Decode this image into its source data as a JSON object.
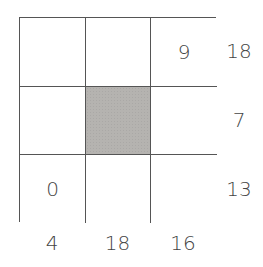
{
  "puzzle": {
    "grid": {
      "rows": 3,
      "cols": 3,
      "cells": [
        [
          {
            "value": "",
            "shaded": false
          },
          {
            "value": "",
            "shaded": false
          },
          {
            "value": "9",
            "shaded": false
          }
        ],
        [
          {
            "value": "",
            "shaded": false
          },
          {
            "value": "",
            "shaded": true
          },
          {
            "value": "",
            "shaded": false
          }
        ],
        [
          {
            "value": "0",
            "shaded": false
          },
          {
            "value": "",
            "shaded": false
          },
          {
            "value": "",
            "shaded": false
          }
        ]
      ]
    },
    "row_sums": [
      "18",
      "7",
      "13"
    ],
    "col_sums": [
      "4",
      "18",
      "16"
    ],
    "colors": {
      "grid_line": "#555555",
      "shaded_cell": "#b5b3b0",
      "text": "#444444",
      "background": "#ffffff"
    }
  }
}
